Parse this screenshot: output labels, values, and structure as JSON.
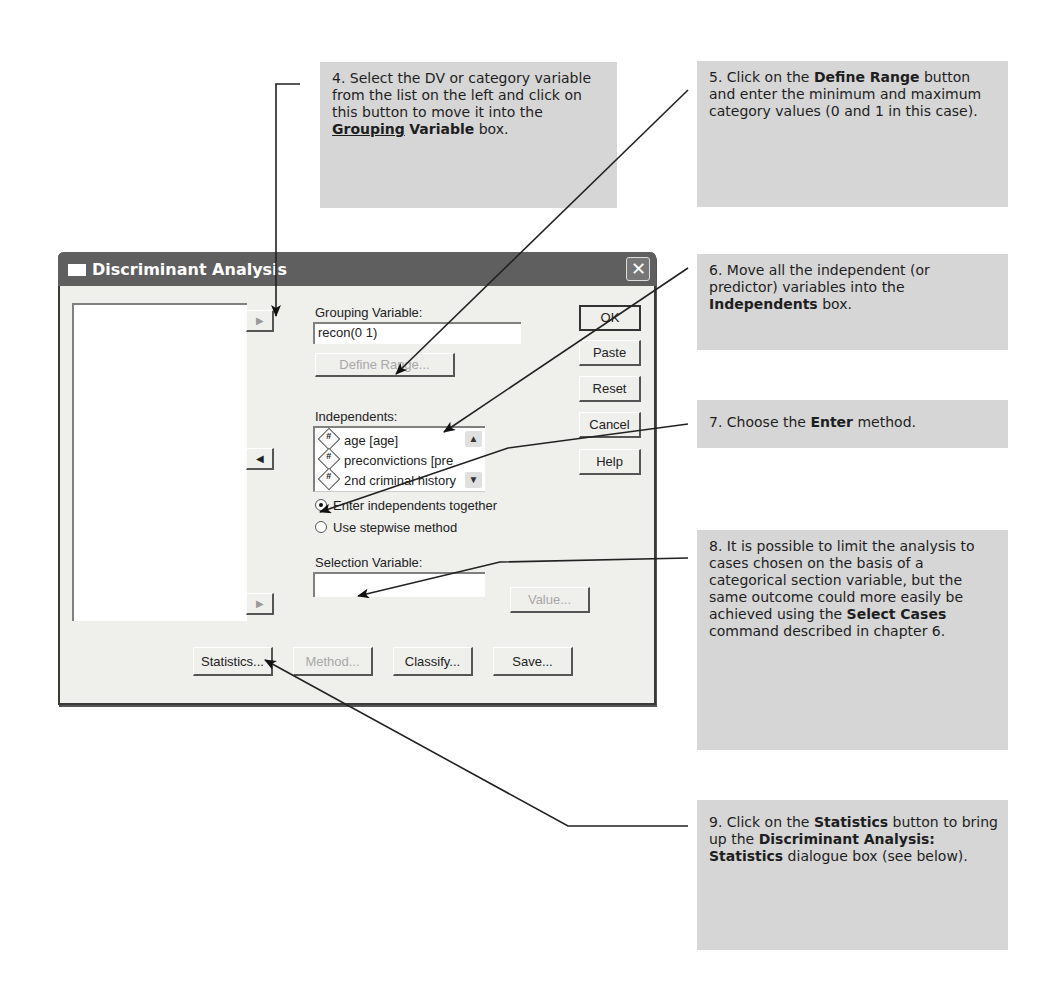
{
  "dialog": {
    "title": "Discriminant Analysis",
    "close_label": "✕",
    "grouping_variable": {
      "label": "Grouping Variable:",
      "value": "recon(0 1)",
      "define_range_label": "Define Range..."
    },
    "independents": {
      "label": "Independents:",
      "items": [
        {
          "icon": "#",
          "label": "age [age]"
        },
        {
          "icon": "#",
          "label": "preconvictions [pre"
        },
        {
          "icon": "#",
          "label": "2nd criminal history"
        }
      ]
    },
    "method_options": [
      {
        "label": "Enter independents together",
        "selected": true
      },
      {
        "label": "Use stepwise method",
        "selected": false
      }
    ],
    "selection_variable": {
      "label": "Selection Variable:",
      "value": "",
      "value_button_label": "Value..."
    },
    "side_buttons": {
      "ok": "OK",
      "paste": "Paste",
      "reset": "Reset",
      "cancel": "Cancel",
      "help": "Help"
    },
    "bottom_buttons": {
      "statistics": "Statistics...",
      "method": "Method...",
      "classify": "Classify...",
      "save": "Save..."
    },
    "move_arrow": "▶",
    "move_back_arrow": "◀",
    "scroll_up": "▲",
    "scroll_down": "▼"
  },
  "callouts": {
    "step4": {
      "pre": "4. Select the DV or category variable from the list on the left and click on this button to move it into the ",
      "bold1": "Grouping",
      "bold2": "Variable",
      "post": " box."
    },
    "step5": {
      "pre": "5. Click on the ",
      "bold": "Define Range",
      "post": " button and enter the minimum and maximum category values (0 and 1 in this case)."
    },
    "step6": {
      "pre": "6. Move all the independent (or predictor) variables into the ",
      "bold": "Independents",
      "post": " box."
    },
    "step7": {
      "pre": "7. Choose the ",
      "bold": "Enter",
      "post": " method."
    },
    "step8": {
      "pre": "8. It is possible to limit the analysis to cases chosen on the basis of a categorical section variable, but the same outcome could more easily be achieved using the ",
      "bold": "Select Cases",
      "post": " command described in chapter 6."
    },
    "step9": {
      "pre": "9. Click on the ",
      "bold1": "Statistics",
      "mid": " button to bring up the ",
      "bold2": "Discriminant Analysis: Statistics",
      "post": " dialogue box (see below)."
    }
  }
}
